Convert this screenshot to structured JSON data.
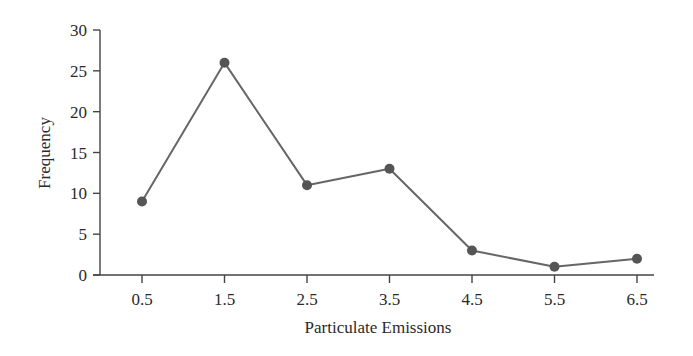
{
  "chart_data": {
    "type": "line",
    "title": "",
    "xlabel": "Particulate Emissions",
    "ylabel": "Frequency",
    "categories": [
      "0.5",
      "1.5",
      "2.5",
      "3.5",
      "4.5",
      "5.5",
      "6.5"
    ],
    "x": [
      0.5,
      1.5,
      2.5,
      3.5,
      4.5,
      5.5,
      6.5
    ],
    "values": [
      9,
      26,
      11,
      13,
      3,
      1,
      2
    ],
    "series": [
      {
        "name": "Frequency",
        "values": [
          9,
          26,
          11,
          13,
          3,
          1,
          2
        ]
      }
    ],
    "ylim": [
      0,
      30
    ],
    "yticks": [
      0,
      5,
      10,
      15,
      20,
      25,
      30
    ],
    "xticks": [
      "0.5",
      "1.5",
      "2.5",
      "3.5",
      "4.5",
      "5.5",
      "6.5"
    ],
    "grid": false,
    "legend": null,
    "markers": true,
    "colors": {
      "line": "#666666",
      "marker": "#555555",
      "axis": "#444444",
      "text": "#2a2a2a"
    }
  }
}
